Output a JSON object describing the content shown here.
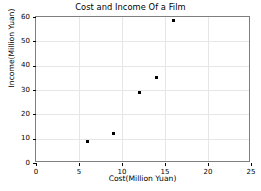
{
  "chart_data": {
    "type": "scatter",
    "title": "Cost and Income Of a Film",
    "xlabel": "Cost(Million Yuan)",
    "ylabel": "Income(Million Yuan)",
    "xlim": [
      0,
      25
    ],
    "ylim": [
      0,
      60
    ],
    "grid": true,
    "legend": null,
    "marker": "square",
    "marker_color": "#000000",
    "x": [
      6,
      9,
      12,
      14,
      16
    ],
    "y": [
      9,
      12,
      29,
      35,
      58.5
    ],
    "points": [
      {
        "x": 6,
        "y": 9
      },
      {
        "x": 9,
        "y": 12
      },
      {
        "x": 12,
        "y": 29
      },
      {
        "x": 14,
        "y": 35
      },
      {
        "x": 16,
        "y": 58.5
      }
    ],
    "xticks": [
      0,
      5,
      10,
      15,
      20,
      25
    ],
    "yticks": [
      0,
      10,
      20,
      30,
      40,
      50,
      60
    ],
    "xticklabels": [
      "0",
      "5",
      "10",
      "15",
      "20",
      "25"
    ],
    "yticklabels": [
      "0",
      "10",
      "20",
      "30",
      "40",
      "50",
      "60"
    ]
  },
  "colors": {
    "background": "#ffffff",
    "axis": "#7f7f7f",
    "grid": "#e6e6e6",
    "text": "#000000",
    "marker": "#000000"
  }
}
